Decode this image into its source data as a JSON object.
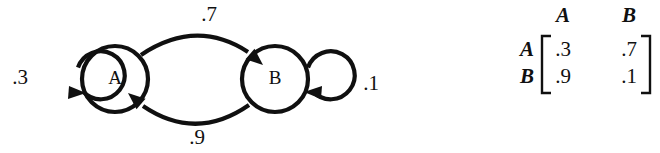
{
  "figure": {
    "background_color": "#ffffff",
    "ink_color": "#101010"
  },
  "diagram": {
    "type": "markov-chain-state-diagram",
    "nodes": [
      {
        "id": "A",
        "label": "A",
        "cx": 115,
        "cy": 79,
        "r": 33
      },
      {
        "id": "B",
        "label": "B",
        "cx": 275,
        "cy": 79,
        "r": 33
      }
    ],
    "self_loops": [
      {
        "id": "A-A",
        "from": "A",
        "to": "A",
        "weight": ".3",
        "side": "left",
        "cx": 62,
        "cy": 80,
        "r": 24,
        "label_x": 20,
        "label_y": 79
      },
      {
        "id": "B-B",
        "from": "B",
        "to": "B",
        "weight": ".1",
        "side": "right",
        "cx": 329,
        "cy": 80,
        "r": 24,
        "label_x": 371,
        "label_y": 85
      }
    ],
    "edges": [
      {
        "id": "A-B",
        "from": "A",
        "to": "B",
        "weight": ".7",
        "curve": "top",
        "label_x": 209,
        "label_y": 16
      },
      {
        "id": "B-A",
        "from": "B",
        "to": "A",
        "weight": ".9",
        "curve": "bottom",
        "label_x": 197,
        "label_y": 139
      }
    ]
  },
  "matrix": {
    "caption": "",
    "column_headers": [
      "A",
      "B"
    ],
    "row_labels": [
      "A",
      "B"
    ],
    "rows": [
      [
        ".3",
        ".7"
      ],
      [
        ".9",
        ".1"
      ]
    ],
    "bracket_style": "square"
  }
}
